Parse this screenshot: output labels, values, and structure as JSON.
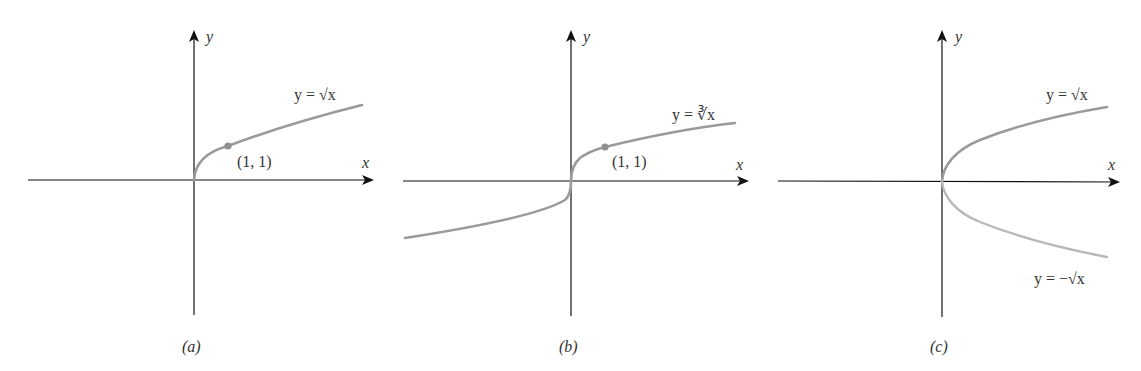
{
  "panels": [
    {
      "id": "a",
      "caption": "(a)",
      "x_axis_label": "x",
      "y_axis_label": "y",
      "curve_label": "y = √x",
      "point_label": "(1, 1)"
    },
    {
      "id": "b",
      "caption": "(b)",
      "x_axis_label": "x",
      "y_axis_label": "y",
      "curve_label": "y = ∛x",
      "point_label": "(1, 1)"
    },
    {
      "id": "c",
      "caption": "(c)",
      "x_axis_label": "x",
      "y_axis_label": "y",
      "curve_label_top": "y = √x",
      "curve_label_bottom": "y = −√x"
    }
  ],
  "colors": {
    "axis": "#111111",
    "curve": "#9a9a9a",
    "curve_light": "#b8b8b8",
    "point": "#8f8f8f",
    "text": "#333333"
  }
}
